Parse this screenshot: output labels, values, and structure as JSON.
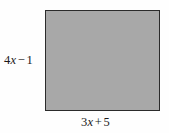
{
  "figure": {
    "type": "geometry-diagram",
    "shape": "rectangle",
    "fill_color": "#a8a8a8",
    "border_color": "#2b2b2b",
    "background_color": "#fefefe",
    "labels": {
      "left": {
        "full_text": "4x − 1",
        "coefficient": "4",
        "variable": "x",
        "operator": "−",
        "constant": "1",
        "position": "left-side-height"
      },
      "bottom": {
        "full_text": "3x + 5",
        "coefficient": "3",
        "variable": "x",
        "operator": "+",
        "constant": "5",
        "position": "bottom-side-width"
      }
    }
  }
}
